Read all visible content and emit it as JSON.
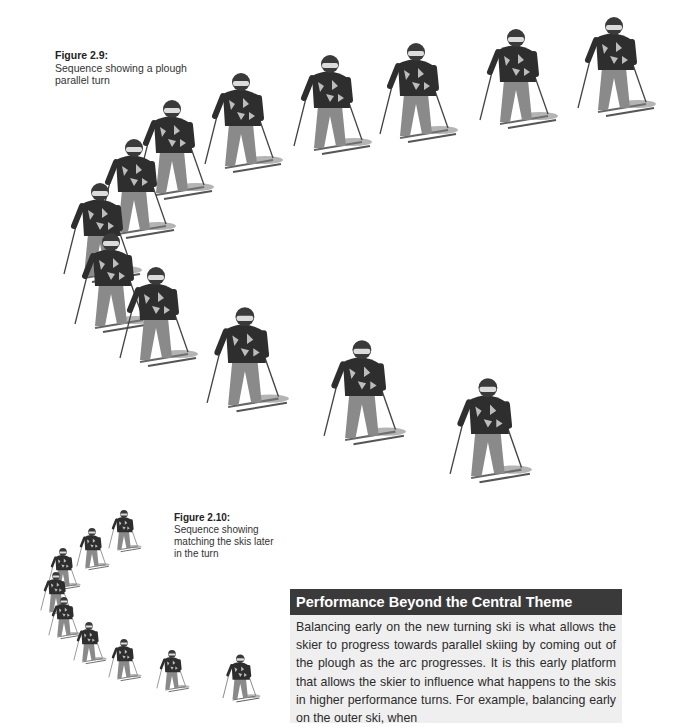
{
  "figures": [
    {
      "id": "2.9",
      "label": "Figure 2.9:",
      "caption": "Sequence showing a plough parallel turn",
      "skiers": [
        {
          "x": 576,
          "y": 12,
          "s": 1.0,
          "flip": false
        },
        {
          "x": 478,
          "y": 24,
          "s": 1.0,
          "flip": false
        },
        {
          "x": 378,
          "y": 38,
          "s": 1.0,
          "flip": false
        },
        {
          "x": 292,
          "y": 50,
          "s": 1.0,
          "flip": false
        },
        {
          "x": 203,
          "y": 68,
          "s": 1.0,
          "flip": false
        },
        {
          "x": 134,
          "y": 95,
          "s": 1.0,
          "flip": false
        },
        {
          "x": 96,
          "y": 134,
          "s": 1.0,
          "flip": false
        },
        {
          "x": 62,
          "y": 178,
          "s": 1.0,
          "flip": false
        },
        {
          "x": 73,
          "y": 228,
          "s": 1.0,
          "flip": false
        },
        {
          "x": 118,
          "y": 262,
          "s": 1.0,
          "flip": false
        },
        {
          "x": 205,
          "y": 302,
          "s": 1.05,
          "flip": false
        },
        {
          "x": 322,
          "y": 335,
          "s": 1.05,
          "flip": false
        },
        {
          "x": 448,
          "y": 373,
          "s": 1.05,
          "flip": false
        }
      ]
    },
    {
      "id": "2.10",
      "label": "Figure 2.10:",
      "caption": "Sequence showing matching the skis later in the turn",
      "skiers": [
        {
          "x": 108,
          "y": 508,
          "s": 0.42,
          "flip": false
        },
        {
          "x": 76,
          "y": 526,
          "s": 0.42,
          "flip": false
        },
        {
          "x": 47,
          "y": 546,
          "s": 0.42,
          "flip": false
        },
        {
          "x": 40,
          "y": 570,
          "s": 0.42,
          "flip": false
        },
        {
          "x": 48,
          "y": 595,
          "s": 0.42,
          "flip": false
        },
        {
          "x": 73,
          "y": 620,
          "s": 0.42,
          "flip": false
        },
        {
          "x": 108,
          "y": 637,
          "s": 0.42,
          "flip": false
        },
        {
          "x": 156,
          "y": 648,
          "s": 0.42,
          "flip": false
        },
        {
          "x": 222,
          "y": 652,
          "s": 0.48,
          "flip": false
        }
      ]
    }
  ],
  "panel": {
    "title": "Performance Beyond the Central Theme",
    "body": "Balancing early on the new turning ski is what allows the skier to progress towards parallel skiing by coming out of the plough as the arc progresses. It is this early platform that allows the skier to influence what happens to the skis in higher performance turns. For example, balancing early on the outer ski, when"
  },
  "colors": {
    "panel_header": "#3a3a3a",
    "panel_bg": "#efefef",
    "text": "#2b2b2b"
  }
}
